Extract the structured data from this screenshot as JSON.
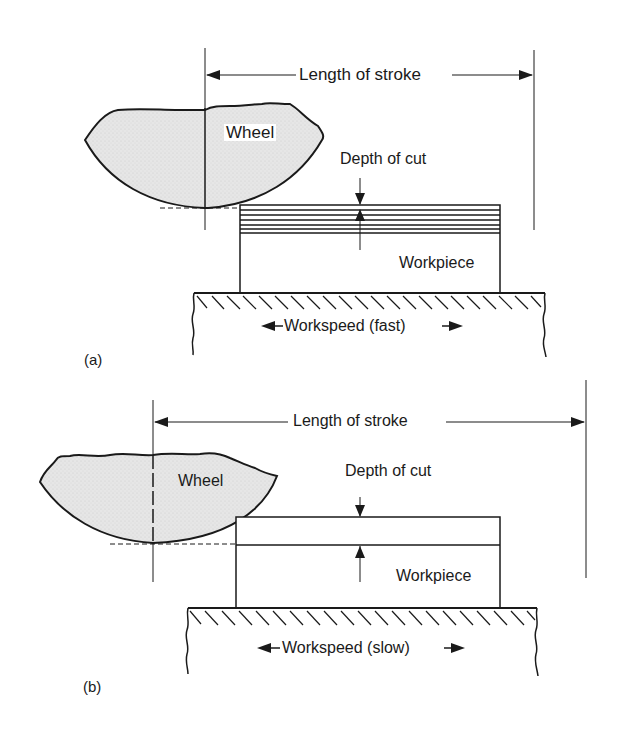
{
  "figure": {
    "panel_a": {
      "label": "(a)",
      "wheel_label": "Wheel",
      "stroke_label": "Length of stroke",
      "depth_label": "Depth of cut",
      "workpiece_label": "Workpiece",
      "workspeed_label": "Workspeed (fast)",
      "pass_layers": 7
    },
    "panel_b": {
      "label": "(b)",
      "wheel_label": "Wheel",
      "stroke_label": "Length of stroke",
      "depth_label": "Depth of cut",
      "workpiece_label": "Workpiece",
      "workspeed_label": "Workspeed (slow)",
      "pass_layers": 1
    },
    "colors": {
      "line": "#1a1a1a",
      "wheel_fill": "#e4e4e4",
      "background": "#ffffff"
    }
  }
}
